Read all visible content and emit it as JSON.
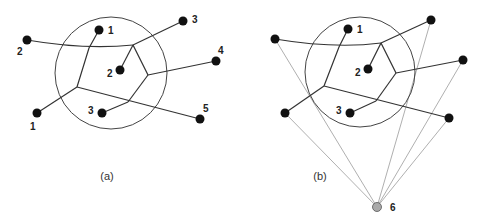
{
  "panels": [
    {
      "caption": "(a)",
      "circle": {
        "cx": 111,
        "cy": 73,
        "r": 56
      },
      "vertices": {
        "A": [
          133,
          45
        ],
        "B": [
          148,
          75
        ],
        "C": [
          128,
          102
        ],
        "D": [
          77,
          87
        ],
        "E": [
          89,
          48
        ]
      },
      "inner_nodes": [
        {
          "label": "1",
          "x": 99,
          "y": 30,
          "lx": 108,
          "ly": 34
        },
        {
          "label": "2",
          "x": 120,
          "y": 70,
          "lx": 107,
          "ly": 77
        },
        {
          "label": "3",
          "x": 102,
          "y": 113,
          "lx": 88,
          "ly": 114
        }
      ],
      "outer_nodes": [
        {
          "label": "1",
          "x": 37,
          "y": 113,
          "lx": 30,
          "ly": 130
        },
        {
          "label": "2",
          "x": 27,
          "y": 40,
          "lx": 17,
          "ly": 55
        },
        {
          "label": "3",
          "x": 183,
          "y": 21,
          "lx": 192,
          "ly": 23
        },
        {
          "label": "4",
          "x": 216,
          "y": 61,
          "lx": 218,
          "ly": 54
        },
        {
          "label": "5",
          "x": 200,
          "y": 119,
          "lx": 203,
          "ly": 112
        }
      ]
    },
    {
      "caption": "(b)",
      "circle": {
        "cx": 360,
        "cy": 72,
        "r": 55
      },
      "vertices": {
        "A": [
          381,
          43
        ],
        "B": [
          396,
          73
        ],
        "C": [
          376,
          101
        ],
        "D": [
          324,
          86
        ],
        "E": [
          339,
          47
        ]
      },
      "inner_nodes": [
        {
          "label": "1",
          "x": 348,
          "y": 29,
          "lx": 357,
          "ly": 33
        },
        {
          "label": "2",
          "x": 368,
          "y": 69,
          "lx": 355,
          "ly": 76
        },
        {
          "label": "3",
          "x": 350,
          "y": 113,
          "lx": 336,
          "ly": 114
        }
      ],
      "outer_nodes": [
        {
          "label": "",
          "x": 285,
          "y": 113
        },
        {
          "label": "",
          "x": 275,
          "y": 39
        },
        {
          "label": "",
          "x": 431,
          "y": 20
        },
        {
          "label": "",
          "x": 463,
          "y": 60
        },
        {
          "label": "",
          "x": 449,
          "y": 118
        }
      ],
      "hub_node": {
        "label": "6",
        "x": 377,
        "y": 207,
        "lx": 392,
        "ly": 211,
        "color": "#aaaaaa"
      }
    }
  ],
  "colors": {
    "node": "#111111",
    "edge": "#333333",
    "hub_edge": "#9a9a9a",
    "circle": "#444444"
  }
}
